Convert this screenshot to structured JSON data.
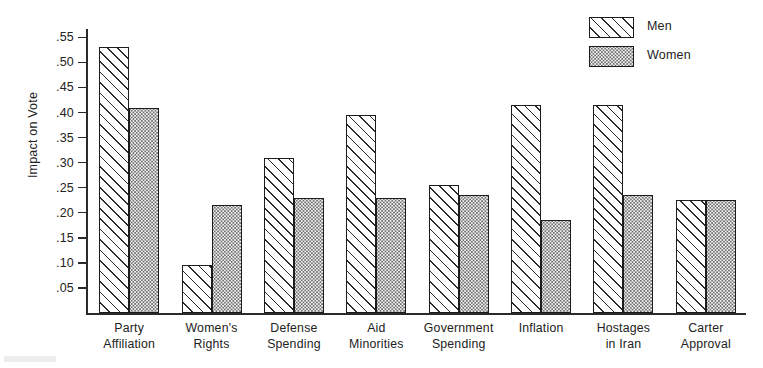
{
  "chart_data": {
    "type": "bar",
    "title": "",
    "subtitle": "",
    "xlabel": "",
    "ylabel": "Impact on Vote",
    "ylim": [
      0,
      0.5667
    ],
    "grid": false,
    "legend_position": "top-right",
    "categories": [
      "Party Affiliation",
      "Women's Rights",
      "Defense Spending",
      "Aid Minorities",
      "Government Spending",
      "Inflation",
      "Hostages in Iran",
      "Carter Approval"
    ],
    "category_lines": [
      [
        "Party",
        "Affiliation"
      ],
      [
        "Women's",
        "Rights"
      ],
      [
        "Defense",
        "Spending"
      ],
      [
        "Aid",
        "Minorities"
      ],
      [
        "Government",
        "Spending"
      ],
      [
        "Inflation",
        ""
      ],
      [
        "Hostages",
        "in Iran"
      ],
      [
        "Carter",
        "Approval"
      ]
    ],
    "series": [
      {
        "name": "Men",
        "pattern": "diagonal-hatch",
        "values": [
          0.53,
          0.095,
          0.31,
          0.395,
          0.255,
          0.415,
          0.415,
          0.225
        ]
      },
      {
        "name": "Women",
        "pattern": "stipple-dots",
        "values": [
          0.41,
          0.215,
          0.23,
          0.23,
          0.235,
          0.185,
          0.235,
          0.225
        ]
      }
    ],
    "y_ticks": [
      0.05,
      0.1,
      0.15,
      0.2,
      0.25,
      0.3,
      0.35,
      0.4,
      0.45,
      0.5,
      0.55
    ],
    "y_tick_labels": [
      ".05",
      ".10",
      ".15",
      ".20",
      ".25",
      ".30",
      ".35",
      ".40",
      ".45",
      ".50",
      ".55"
    ]
  },
  "legend": {
    "items": [
      {
        "label": "Men"
      },
      {
        "label": "Women"
      }
    ]
  },
  "colors": {
    "axis": "#2a2a2a",
    "bar_outline": "#1c1c1c",
    "text": "#222222",
    "background": "#ffffff"
  }
}
